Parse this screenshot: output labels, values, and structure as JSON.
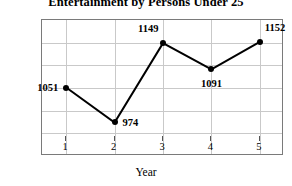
{
  "chart_data": {
    "type": "line",
    "title": "Entertainment by Persons Under 25",
    "xlabel": "Year",
    "ylabel": "Amount (dollars)",
    "categories": [
      1,
      2,
      3,
      4,
      5
    ],
    "x_tick_labels": [
      "1",
      "2",
      "3",
      "4",
      "5"
    ],
    "values": [
      1051,
      974,
      1149,
      1091,
      1152
    ],
    "point_labels": [
      "1051",
      "974",
      "1149",
      "1091",
      "1152"
    ],
    "label_positions": [
      "left",
      "right",
      "above-left",
      "below",
      "above-right"
    ],
    "ylim": [
      900,
      1200
    ],
    "ytick_step": 50,
    "y_tick_labels": [
      "1200",
      "1150",
      "1100",
      "1050",
      "1000",
      "950",
      "900"
    ],
    "xlim": [
      0.5,
      5.5
    ],
    "grid": true,
    "legend": "none",
    "series_color": "#000000",
    "grid_color": "#c9c9c9",
    "axis_color": "#7a7a7a",
    "background_color": "#ffffff"
  }
}
